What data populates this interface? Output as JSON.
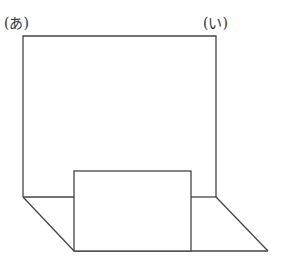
{
  "diagram": {
    "labels": {
      "a": "(あ)",
      "i": "(い)"
    },
    "stroke_color": "#444444",
    "background": "#ffffff"
  }
}
